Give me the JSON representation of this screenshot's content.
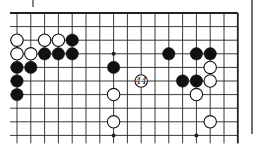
{
  "diagram": {
    "type": "go-board-fragment",
    "columns": 17,
    "rows": 10,
    "top_edge": true,
    "right_edge": true,
    "colors": {
      "line": "#222222",
      "black": "#111111",
      "white": "#ffffff",
      "paper": "#fbfbfb"
    },
    "hoshi": [
      [
        7,
        3
      ],
      [
        7,
        9
      ],
      [
        13,
        9
      ]
    ],
    "stones": [
      {
        "c": 0,
        "r": 2,
        "color": "white"
      },
      {
        "c": 2,
        "r": 2,
        "color": "white"
      },
      {
        "c": 3,
        "r": 2,
        "color": "white"
      },
      {
        "c": 4,
        "r": 2,
        "color": "black"
      },
      {
        "c": 0,
        "r": 3,
        "color": "white"
      },
      {
        "c": 1,
        "r": 3,
        "color": "white"
      },
      {
        "c": 2,
        "r": 3,
        "color": "black"
      },
      {
        "c": 3,
        "r": 3,
        "color": "black"
      },
      {
        "c": 4,
        "r": 3,
        "color": "black"
      },
      {
        "c": 11,
        "r": 3,
        "color": "black"
      },
      {
        "c": 13,
        "r": 3,
        "color": "black"
      },
      {
        "c": 14,
        "r": 3,
        "color": "black"
      },
      {
        "c": 0,
        "r": 4,
        "color": "black"
      },
      {
        "c": 1,
        "r": 4,
        "color": "black"
      },
      {
        "c": 7,
        "r": 4,
        "color": "black"
      },
      {
        "c": 14,
        "r": 4,
        "color": "white"
      },
      {
        "c": 0,
        "r": 5,
        "color": "black"
      },
      {
        "c": 12,
        "r": 5,
        "color": "black"
      },
      {
        "c": 13,
        "r": 5,
        "color": "black"
      },
      {
        "c": 14,
        "r": 5,
        "color": "white"
      },
      {
        "c": 0,
        "r": 6,
        "color": "black"
      },
      {
        "c": 7,
        "r": 6,
        "color": "white"
      },
      {
        "c": 13,
        "r": 6,
        "color": "white"
      },
      {
        "c": 7,
        "r": 8,
        "color": "white"
      },
      {
        "c": 14,
        "r": 8,
        "color": "white"
      }
    ],
    "numbered_stones": [
      {
        "c": 9,
        "r": 5,
        "color": "white",
        "label": "44"
      }
    ]
  }
}
